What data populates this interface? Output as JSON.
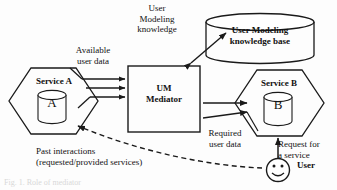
{
  "figure": {
    "caption": "Fig. 1. Role of mediator"
  },
  "nodes": {
    "service_a": {
      "label": "Service A",
      "store_label": "A",
      "shape": "hexagon"
    },
    "service_b": {
      "label": "Service B",
      "store_label": "B",
      "shape": "hexagon"
    },
    "mediator": {
      "label": "UM\nMediator",
      "shape": "rectangle"
    },
    "knowledge_base": {
      "label": "User Modeling\nknowledge base",
      "shape": "cylinder"
    },
    "user": {
      "label": "User",
      "shape": "smiley-face"
    }
  },
  "edge_labels": {
    "available_user_data": "Available\nuser data",
    "um_knowledge": "User\nModeling\nknowledge",
    "required_user_data": "Required\nuser data",
    "request_for_service": "Request for\na service",
    "past_interactions": "Past interactions\n(requested/provided services)"
  },
  "colors": {
    "background": "#fdfdfd",
    "stroke": "#1a1a1a",
    "text": "#111111"
  }
}
